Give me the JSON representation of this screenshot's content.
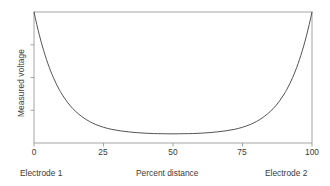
{
  "chart_data": {
    "type": "line",
    "title": "",
    "subtitle": "",
    "xlabel": "Percent distance",
    "ylabel": "Measured voltage",
    "xlim": [
      0,
      100
    ],
    "ylim": [
      0,
      1
    ],
    "grid": false,
    "legend": false,
    "legend_position": "none",
    "xticks": [
      "0",
      "25",
      "50",
      "75",
      "100"
    ],
    "xtick_values": [
      0,
      25,
      50,
      75,
      100
    ],
    "yticks": [
      "",
      "",
      ""
    ],
    "ytick_values": [
      0.25,
      0.5,
      0.75
    ],
    "ytick_labels_shown": false,
    "annotations": [
      {
        "text": "Electrode 1",
        "position": "below-axis-left"
      },
      {
        "text": "Percent distance",
        "position": "below-axis-center"
      },
      {
        "text": "Electrode 2",
        "position": "below-axis-right"
      }
    ],
    "series": [
      {
        "name": "Measured voltage profile",
        "color": "#3f3f3f",
        "linewidth": 0.9,
        "x": [
          0,
          1,
          2,
          3,
          4,
          5,
          6,
          7,
          8,
          9,
          10,
          12,
          14,
          16,
          18,
          20,
          22,
          25,
          28,
          31,
          34,
          37,
          40,
          43,
          46,
          50,
          54,
          57,
          60,
          63,
          66,
          69,
          72,
          75,
          78,
          80,
          82,
          84,
          86,
          88,
          90,
          91,
          92,
          93,
          94,
          95,
          96,
          97,
          98,
          99,
          100
        ],
        "y": [
          1.0,
          0.905,
          0.818,
          0.74,
          0.67,
          0.606,
          0.549,
          0.498,
          0.452,
          0.411,
          0.374,
          0.312,
          0.262,
          0.222,
          0.19,
          0.164,
          0.143,
          0.12,
          0.104,
          0.093,
          0.085,
          0.079,
          0.075,
          0.072,
          0.071,
          0.07,
          0.071,
          0.072,
          0.075,
          0.079,
          0.085,
          0.093,
          0.104,
          0.12,
          0.143,
          0.164,
          0.19,
          0.222,
          0.262,
          0.312,
          0.374,
          0.411,
          0.452,
          0.498,
          0.549,
          0.606,
          0.67,
          0.74,
          0.818,
          0.905,
          1.0
        ]
      }
    ]
  },
  "style": {
    "axis_color": "#9a9a9a",
    "curve_color": "#3f3f3f",
    "text_color": "#3a3a3a",
    "background": "#ffffff"
  }
}
